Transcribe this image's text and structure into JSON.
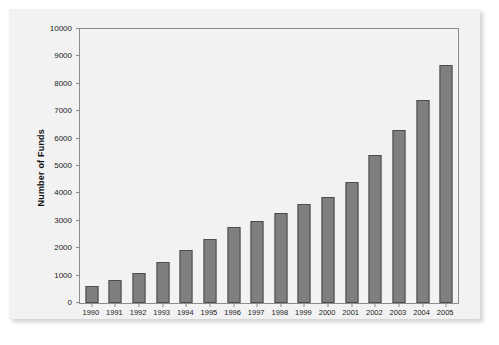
{
  "chart_data": {
    "type": "bar",
    "title": "",
    "subtitle": "",
    "xlabel": "",
    "ylabel": "Number of Funds",
    "categories": [
      "1990",
      "1991",
      "1992",
      "1993",
      "1994",
      "1995",
      "1996",
      "1997",
      "1998",
      "1999",
      "2000",
      "2001",
      "2002",
      "2003",
      "2004",
      "2005"
    ],
    "values": [
      620,
      830,
      1100,
      1500,
      1950,
      2330,
      2780,
      3000,
      3300,
      3600,
      3870,
      4400,
      5400,
      6300,
      7400,
      8700
    ],
    "series": [
      {
        "name": "Number of Funds",
        "values": [
          620,
          830,
          1100,
          1500,
          1950,
          2330,
          2780,
          3000,
          3300,
          3600,
          3870,
          4400,
          5400,
          6300,
          7400,
          8700
        ]
      }
    ],
    "ylim": [
      0,
      10000
    ],
    "ytick_values": [
      0,
      1000,
      2000,
      3000,
      4000,
      5000,
      6000,
      7000,
      8000,
      9000,
      10000
    ],
    "ytick_labels": [
      "0",
      "1000",
      "2000",
      "3000",
      "4000",
      "5000",
      "6000",
      "7000",
      "8000",
      "9000",
      "10000"
    ],
    "grid": false,
    "legend": null,
    "legend_position": "none",
    "bar_color": "#7f7f7f",
    "bar_edge_color": "#4d4d4d",
    "plot_background": "#f2f2f2",
    "axis_color": "#8c8c8c"
  }
}
